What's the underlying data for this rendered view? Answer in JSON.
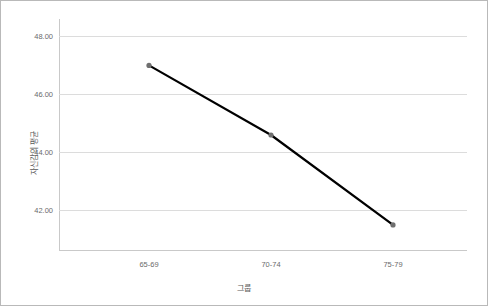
{
  "chart_data": {
    "type": "line",
    "title": "",
    "xlabel": "그룹",
    "ylabel": "자신감의 평균",
    "categories": [
      "65-69",
      "70-74",
      "75-79"
    ],
    "values": [
      47.0,
      44.6,
      41.5
    ],
    "series": [
      {
        "name": "자신감의 평균",
        "values": [
          47.0,
          44.6,
          41.5
        ]
      }
    ],
    "ylim": [
      40.6,
      48.6
    ],
    "yticks": [
      "42.00",
      "44.00",
      "46.00",
      "48.00"
    ],
    "ytick_values": [
      42,
      44,
      46,
      48
    ],
    "grid": true,
    "legend": "none",
    "line_color": "#000000",
    "marker_color": "#6f6f6f",
    "grid_color": "#dcdcdc",
    "axis_color": "#c9c9c9",
    "tick_label_color": "#6b6b6b",
    "border_color": "#b9b9b9",
    "background": "#ffffff"
  }
}
